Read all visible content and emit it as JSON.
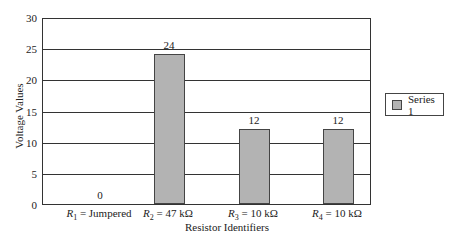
{
  "chart_data": {
    "type": "bar",
    "title": "",
    "xlabel": "Resistor Identifiers",
    "ylabel": "Voltage Values",
    "ylim": [
      0,
      30
    ],
    "yticks": [
      0,
      5,
      10,
      15,
      20,
      25,
      30
    ],
    "grid": true,
    "legend_position": "right",
    "categories": [
      {
        "sym": "R",
        "sub": "1",
        "rest": " = Jumpered"
      },
      {
        "sym": "R",
        "sub": "2",
        "rest": " = 47 kΩ"
      },
      {
        "sym": "R",
        "sub": "3",
        "rest": " = 10 kΩ"
      },
      {
        "sym": "R",
        "sub": "4",
        "rest": " = 10 kΩ"
      }
    ],
    "category_labels": [
      "R1 = Jumpered",
      "R2 = 47 kΩ",
      "R3 = 10 kΩ",
      "R4 = 10 kΩ"
    ],
    "series": [
      {
        "name": "Series 1",
        "values": [
          0,
          24,
          12,
          12
        ],
        "color": "#b3b3b3"
      }
    ],
    "data_labels": [
      "0",
      "24",
      "12",
      "12"
    ]
  }
}
